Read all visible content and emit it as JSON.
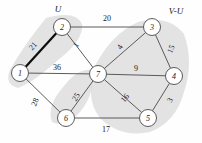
{
  "figure": {
    "set_labels": [
      {
        "name": "u-set-label",
        "text": "U",
        "x": 58,
        "y": 9
      },
      {
        "name": "v-minus-u-set-label",
        "text": "V-U",
        "x": 176,
        "y": 11
      }
    ],
    "nodes": [
      {
        "id": "1",
        "label": "1",
        "x": 20,
        "y": 73,
        "r": 8.5
      },
      {
        "id": "2",
        "label": "2",
        "x": 62,
        "y": 27,
        "r": 8.5
      },
      {
        "id": "3",
        "label": "3",
        "x": 152,
        "y": 27,
        "r": 8.5
      },
      {
        "id": "4",
        "label": "4",
        "x": 174,
        "y": 76,
        "r": 8.5
      },
      {
        "id": "5",
        "label": "5",
        "x": 148,
        "y": 118,
        "r": 8.5
      },
      {
        "id": "6",
        "label": "6",
        "x": 66,
        "y": 118,
        "r": 8.5
      },
      {
        "id": "7",
        "label": "7",
        "x": 98,
        "y": 74,
        "r": 8.5
      }
    ],
    "edges": [
      {
        "id": "e-1-2",
        "from": "1",
        "to": "2",
        "weight": "21",
        "bold": true,
        "lx": 33,
        "ly": 46,
        "rot": -48
      },
      {
        "id": "e-2-3",
        "from": "2",
        "to": "3",
        "weight": "20",
        "bold": false,
        "lx": 107,
        "ly": 18,
        "rot": 0
      },
      {
        "id": "e-2-7",
        "from": "2",
        "to": "7",
        "weight": "1",
        "bold": false,
        "lx": 76,
        "ly": 45,
        "rot": -55
      },
      {
        "id": "e-1-7",
        "from": "1",
        "to": "7",
        "weight": "36",
        "bold": false,
        "lx": 57,
        "ly": 67,
        "rot": 0
      },
      {
        "id": "e-1-6",
        "from": "1",
        "to": "6",
        "weight": "28",
        "bold": false,
        "lx": 35,
        "ly": 102,
        "rot": -66
      },
      {
        "id": "e-3-7",
        "from": "3",
        "to": "7",
        "weight": "4",
        "bold": false,
        "lx": 120,
        "ly": 47,
        "rot": -58
      },
      {
        "id": "e-3-4",
        "from": "3",
        "to": "4",
        "weight": "15",
        "bold": false,
        "lx": 171,
        "ly": 49,
        "rot": -66
      },
      {
        "id": "e-7-4",
        "from": "7",
        "to": "4",
        "weight": "9",
        "bold": false,
        "lx": 136,
        "ly": 68,
        "rot": 0
      },
      {
        "id": "e-4-5",
        "from": "4",
        "to": "5",
        "weight": "3",
        "bold": false,
        "lx": 170,
        "ly": 100,
        "rot": -62
      },
      {
        "id": "e-7-5",
        "from": "7",
        "to": "5",
        "weight": "16",
        "bold": false,
        "lx": 125,
        "ly": 98,
        "rot": -50
      },
      {
        "id": "e-7-6",
        "from": "7",
        "to": "6",
        "weight": "25",
        "bold": false,
        "lx": 76,
        "ly": 97,
        "rot": -57
      },
      {
        "id": "e-6-5",
        "from": "6",
        "to": "5",
        "weight": "17",
        "bold": false,
        "lx": 106,
        "ly": 129,
        "rot": 0
      }
    ],
    "regions": [
      {
        "id": "region-u",
        "name": "u-shaded-region",
        "d": "M 46 18 Q 76 10 82 24 Q 84 40 58 60 Q 34 82 18 88 Q 4 84 10 70 Q 22 48 46 18 Z"
      },
      {
        "id": "region-v-minus-u",
        "name": "v-minus-u-shaded-region",
        "d": "M 96 64 Q 112 34 138 22 Q 168 14 184 34 Q 194 62 184 92 Q 176 122 150 132 Q 120 138 100 118 Q 84 98 96 64 Z"
      },
      {
        "id": "region-lower-band",
        "name": "lower-shaded-band",
        "d": "M 92 70 Q 96 92 80 112 Q 66 128 52 122 Q 46 106 64 86 Q 78 68 92 70 Z"
      }
    ],
    "colors": {
      "edge": "#4a4a4a",
      "edge_bold": "#0d0d0d",
      "node_fill": "#ffffff",
      "region_shade": "#d8d8d8",
      "text": "#1a1a1a",
      "background": "#fefefe"
    }
  }
}
